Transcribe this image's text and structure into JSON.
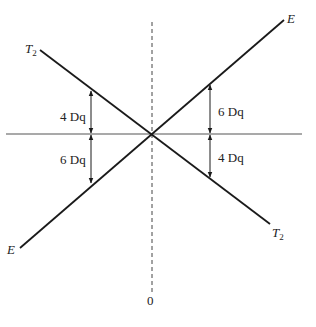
{
  "diagram": {
    "title": "",
    "origin_label": "0",
    "lines": [
      {
        "name": "E",
        "label_start": "E",
        "label_end": "E",
        "slope": "increasing"
      },
      {
        "name": "T2",
        "label_start": "T",
        "label_start_sub": "2",
        "label_end": "T",
        "label_end_sub": "2",
        "slope": "decreasing"
      }
    ],
    "annotations": {
      "left_upper": "4 Dq",
      "left_lower": "6 Dq",
      "right_upper": "6 Dq",
      "right_lower": "4 Dq"
    },
    "colors": {
      "line": "#1a1a1a",
      "axis": "#555555",
      "background": "#ffffff"
    }
  }
}
